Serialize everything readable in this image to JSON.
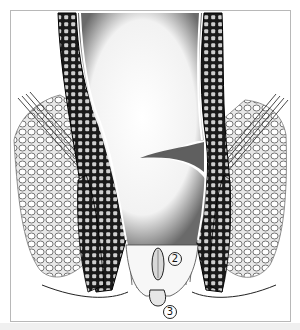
{
  "figure": {
    "type": "anatomical-illustration",
    "style": "black-and-white stipple/line drawing",
    "labels": [
      {
        "id": "label-2",
        "text": "2",
        "x": 174,
        "y": 258
      },
      {
        "id": "label-3",
        "text": "3",
        "x": 169,
        "y": 311
      }
    ],
    "colors": {
      "ink": "#111111",
      "frame": "#b8b8b8",
      "background": "#ffffff",
      "bottom_strip": "#f0f0f0"
    }
  }
}
